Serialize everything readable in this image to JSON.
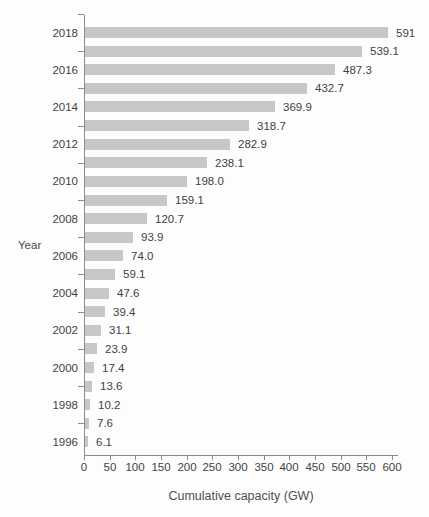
{
  "figure": {
    "background_color": "#fdfdfd",
    "bar_color": "#c7c7c7",
    "axis_color": "#8c8c8c",
    "text_color": "#424242"
  },
  "chart_data": {
    "type": "bar",
    "orientation": "horizontal",
    "title": "",
    "xlabel": "Cumulative capacity (GW)",
    "ylabel": "Year",
    "xlim": [
      0,
      600
    ],
    "x_ticks": [
      0,
      50,
      100,
      150,
      200,
      250,
      300,
      350,
      400,
      450,
      500,
      550,
      600
    ],
    "grid": false,
    "legend_position": "none",
    "categories": [
      2018,
      2017,
      2016,
      2015,
      2014,
      2013,
      2012,
      2011,
      2010,
      2009,
      2008,
      2007,
      2006,
      2005,
      2004,
      2003,
      2002,
      2001,
      2000,
      1999,
      1998,
      1997,
      1996
    ],
    "values": [
      591,
      539.1,
      487.3,
      432.7,
      369.9,
      318.7,
      282.9,
      238.1,
      198.0,
      159.1,
      120.7,
      93.9,
      74.0,
      59.1,
      47.6,
      39.4,
      31.1,
      23.9,
      17.4,
      13.6,
      10.2,
      7.6,
      6.1
    ],
    "value_labels": [
      "591",
      "539.1",
      "487.3",
      "432.7",
      "369.9",
      "318.7",
      "282.9",
      "238.1",
      "198.0",
      "159.1",
      "120.7",
      "93.9",
      "74.0",
      "59.1",
      "47.6",
      "39.4",
      "31.1",
      "23.9",
      "17.4",
      "13.6",
      "10.2",
      "7.6",
      "6.1"
    ],
    "year_tick_labels": [
      "2018",
      "",
      "2016",
      "",
      "2014",
      "",
      "2012",
      "",
      "2010",
      "",
      "2008",
      "",
      "2006",
      "",
      "2004",
      "",
      "2002",
      "",
      "2000",
      "",
      "1998",
      "",
      "1996"
    ]
  }
}
